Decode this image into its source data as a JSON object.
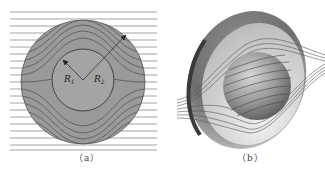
{
  "figure": {
    "panels": [
      {
        "id": "a",
        "caption": "（a）",
        "description": "Cross-section of spherical shell with field lines",
        "labels": {
          "inner_radius": "R",
          "inner_sub": "1",
          "outer_radius": "R",
          "outer_sub": "2"
        }
      },
      {
        "id": "b",
        "caption": "（b）",
        "description": "3D cutaway of spherical shell with field lines"
      }
    ],
    "colors": {
      "shell_fill": "#9a9a9a",
      "line": "#555555",
      "background": "#ffffff"
    }
  }
}
